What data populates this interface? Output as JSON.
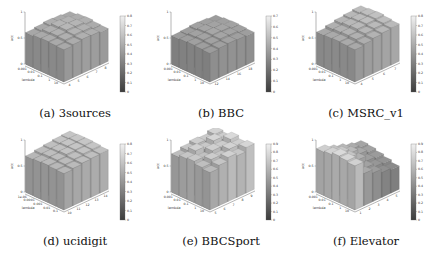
{
  "figure": {
    "panels": [
      {
        "id": "a",
        "caption": "(a) 3sources"
      },
      {
        "id": "b",
        "caption": "(b) BBC"
      },
      {
        "id": "c",
        "caption": "(c) MSRC_v1"
      },
      {
        "id": "d",
        "caption": "(d) ucidigit"
      },
      {
        "id": "e",
        "caption": "(e) BBCSport"
      },
      {
        "id": "f",
        "caption": "(f) Elevator"
      }
    ]
  },
  "chart_data": [
    {
      "type": "bar3d",
      "title": "(a) 3sources",
      "zlabel": "acc",
      "ylabel": "lambda",
      "zticks": [
        "0",
        "0.5",
        "1"
      ],
      "yticks": [
        "0.001",
        "0.01",
        "0.1",
        "1",
        "10"
      ],
      "xticks": [
        "4",
        "5",
        "6",
        "7",
        "8"
      ],
      "colorbar_ticks": [
        "0",
        "0.1",
        "0.2",
        "0.3",
        "0.4",
        "0.5",
        "0.6",
        "0.7",
        "0.8"
      ],
      "zlim": [
        0,
        1
      ],
      "values": [
        [
          0.62,
          0.64,
          0.66,
          0.65,
          0.63
        ],
        [
          0.63,
          0.66,
          0.68,
          0.67,
          0.64
        ],
        [
          0.64,
          0.67,
          0.7,
          0.69,
          0.66
        ],
        [
          0.63,
          0.66,
          0.69,
          0.68,
          0.65
        ],
        [
          0.61,
          0.63,
          0.65,
          0.64,
          0.62
        ]
      ]
    },
    {
      "type": "bar3d",
      "title": "(b) BBC",
      "zlabel": "acc",
      "ylabel": "lambda",
      "zticks": [
        "0",
        "0.5",
        "1"
      ],
      "yticks": [
        "0.001",
        "0.01",
        "0.1",
        "1",
        "10"
      ],
      "xticks": [
        "12",
        "14",
        "16",
        "18"
      ],
      "colorbar_ticks": [
        "0",
        "0.1",
        "0.2",
        "0.3",
        "0.4",
        "0.5",
        "0.6",
        "0.7"
      ],
      "zlim": [
        0,
        1
      ],
      "values": [
        [
          0.55,
          0.57,
          0.58,
          0.57,
          0.56
        ],
        [
          0.56,
          0.58,
          0.6,
          0.59,
          0.57
        ],
        [
          0.57,
          0.59,
          0.61,
          0.6,
          0.58
        ],
        [
          0.56,
          0.58,
          0.6,
          0.59,
          0.57
        ],
        [
          0.55,
          0.56,
          0.58,
          0.57,
          0.55
        ]
      ]
    },
    {
      "type": "bar3d",
      "title": "(c) MSRC_v1",
      "zlabel": "acc",
      "ylabel": "lambda",
      "zticks": [
        "0",
        "0.5",
        "1"
      ],
      "yticks": [
        "0.001",
        "0.01",
        "0.1",
        "1",
        "10"
      ],
      "xticks": [
        "4",
        "5",
        "6",
        "7"
      ],
      "colorbar_ticks": [
        "0",
        "0.1",
        "0.2",
        "0.3",
        "0.4",
        "0.5",
        "0.6",
        "0.7",
        "0.8"
      ],
      "zlim": [
        0,
        1
      ],
      "values": [
        [
          0.62,
          0.65,
          0.68,
          0.7,
          0.72
        ],
        [
          0.63,
          0.67,
          0.7,
          0.72,
          0.74
        ],
        [
          0.64,
          0.68,
          0.72,
          0.74,
          0.76
        ],
        [
          0.63,
          0.67,
          0.71,
          0.73,
          0.75
        ],
        [
          0.62,
          0.66,
          0.69,
          0.71,
          0.73
        ]
      ]
    },
    {
      "type": "bar3d",
      "title": "(d) ucidigit",
      "zlabel": "acc",
      "ylabel": "lambda",
      "zticks": [
        "0",
        "0.5",
        "1"
      ],
      "yticks": [
        "1e-06",
        "0.0001",
        "0.001",
        "0.01",
        "0.1"
      ],
      "xticks": [
        "10",
        "11",
        "12",
        "13",
        "14"
      ],
      "colorbar_ticks": [
        "0",
        "0.1",
        "0.2",
        "0.3",
        "0.4",
        "0.5",
        "0.6",
        "0.7",
        "0.8"
      ],
      "zlim": [
        0,
        1
      ],
      "values": [
        [
          0.7,
          0.72,
          0.74,
          0.75,
          0.76
        ],
        [
          0.71,
          0.73,
          0.75,
          0.77,
          0.78
        ],
        [
          0.72,
          0.74,
          0.77,
          0.78,
          0.79
        ],
        [
          0.71,
          0.74,
          0.76,
          0.78,
          0.79
        ],
        [
          0.7,
          0.73,
          0.75,
          0.77,
          0.78
        ]
      ]
    },
    {
      "type": "bar3d",
      "title": "(e) BBCSport",
      "zlabel": "acc",
      "ylabel": "lambda",
      "zticks": [
        "0",
        "0.5",
        "1"
      ],
      "yticks": [
        "0.001",
        "0.01",
        "0.1",
        "1",
        "10"
      ],
      "xticks": [
        "5",
        "6",
        "7",
        "8",
        "9"
      ],
      "colorbar_ticks": [
        "0",
        "0.1",
        "0.2",
        "0.3",
        "0.4",
        "0.5",
        "0.6",
        "0.7",
        "0.8",
        "0.9"
      ],
      "zlim": [
        0,
        1
      ],
      "values": [
        [
          0.72,
          0.78,
          0.85,
          0.8,
          0.88
        ],
        [
          0.75,
          0.82,
          0.78,
          0.86,
          0.84
        ],
        [
          0.8,
          0.76,
          0.84,
          0.82,
          0.9
        ],
        [
          0.78,
          0.85,
          0.8,
          0.88,
          0.83
        ],
        [
          0.74,
          0.79,
          0.83,
          0.81,
          0.86
        ]
      ]
    },
    {
      "type": "bar3d",
      "title": "(f) Elevator",
      "zlabel": "acc",
      "ylabel": "lambda",
      "zticks": [
        "0",
        "0.5",
        "1"
      ],
      "yticks": [
        "0.001",
        "0.01",
        "0.1",
        "1",
        "10"
      ],
      "xticks": [
        "1",
        "2",
        "3",
        "4",
        "5"
      ],
      "colorbar_ticks": [
        "0",
        "0.1",
        "0.2",
        "0.3",
        "0.4",
        "0.5",
        "0.6",
        "0.7",
        "0.8",
        "0.9"
      ],
      "zlim": [
        0,
        1
      ],
      "values": [
        [
          0.85,
          0.62,
          0.55,
          0.48,
          0.45
        ],
        [
          0.88,
          0.7,
          0.58,
          0.52,
          0.5
        ],
        [
          0.9,
          0.78,
          0.66,
          0.56,
          0.54
        ],
        [
          0.86,
          0.8,
          0.72,
          0.62,
          0.58
        ],
        [
          0.84,
          0.76,
          0.7,
          0.64,
          0.6
        ]
      ]
    }
  ]
}
